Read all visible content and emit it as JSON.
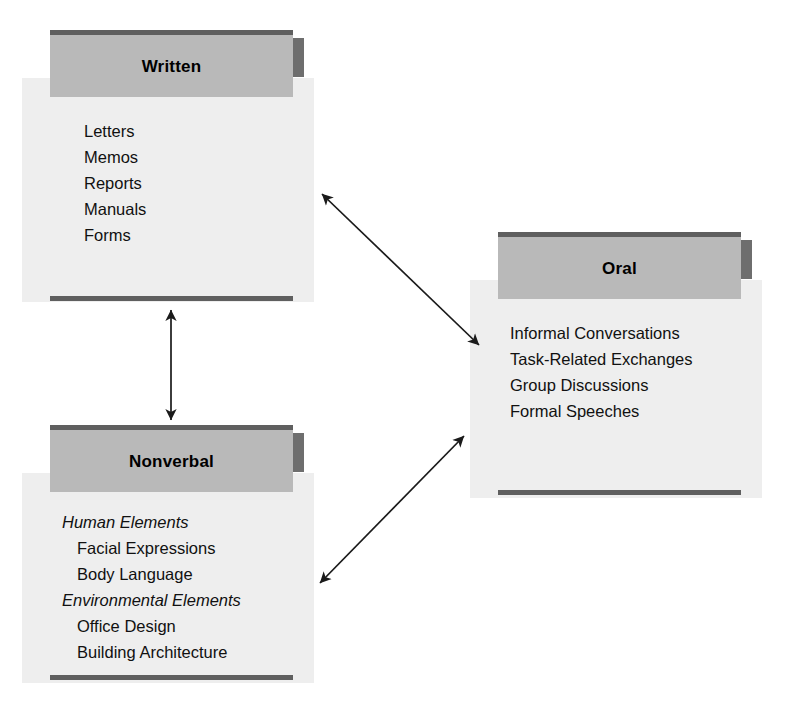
{
  "diagram": {
    "background_color": "#ffffff",
    "palette": {
      "header_fill": "#b9b9b9",
      "body_fill": "#eeeeee",
      "rule_dark": "#5f5f5f",
      "tab_dark": "#6e6e6e",
      "text": "#111111",
      "arrow": "#1a1a1a"
    },
    "cards": [
      {
        "id": "written",
        "title": "Written",
        "items": [
          {
            "text": "Letters",
            "style": "plain"
          },
          {
            "text": "Memos",
            "style": "plain"
          },
          {
            "text": "Reports",
            "style": "plain"
          },
          {
            "text": "Manuals",
            "style": "plain"
          },
          {
            "text": "Forms",
            "style": "plain"
          }
        ]
      },
      {
        "id": "oral",
        "title": "Oral",
        "items": [
          {
            "text": "Informal Conversations",
            "style": "plain"
          },
          {
            "text": "Task-Related Exchanges",
            "style": "plain"
          },
          {
            "text": "Group Discussions",
            "style": "plain"
          },
          {
            "text": "Formal Speeches",
            "style": "plain"
          }
        ]
      },
      {
        "id": "nonverbal",
        "title": "Nonverbal",
        "items": [
          {
            "text": "Human Elements",
            "style": "group"
          },
          {
            "text": "Facial Expressions",
            "style": "child"
          },
          {
            "text": "Body Language",
            "style": "child"
          },
          {
            "text": "Environmental Elements",
            "style": "group"
          },
          {
            "text": "Office Design",
            "style": "child"
          },
          {
            "text": "Building Architecture",
            "style": "child"
          }
        ]
      }
    ],
    "connectors": [
      {
        "id": "written-oral",
        "from": "written",
        "to": "oral",
        "kind": "double-headed-arrow",
        "orientation": "diagonal-down-right"
      },
      {
        "id": "written-nonverbal",
        "from": "written",
        "to": "nonverbal",
        "kind": "double-headed-arrow",
        "orientation": "vertical"
      },
      {
        "id": "nonverbal-oral",
        "from": "nonverbal",
        "to": "oral",
        "kind": "double-headed-arrow",
        "orientation": "diagonal-up-right"
      }
    ]
  }
}
